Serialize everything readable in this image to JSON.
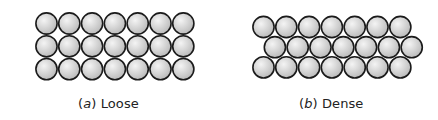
{
  "figure": {
    "panels": [
      {
        "id": "loose",
        "caption_prefix": "(",
        "caption_letter": "a",
        "caption_suffix": ")",
        "caption_text": "Loose",
        "arrangement": "square",
        "rows": 3,
        "cols": 7,
        "row_offsets": [
          0,
          0,
          0
        ]
      },
      {
        "id": "dense",
        "caption_prefix": "(",
        "caption_letter": "b",
        "caption_suffix": ")",
        "caption_text": "Dense",
        "arrangement": "hexagonal",
        "rows": 3,
        "cols": 7,
        "row_offsets": [
          0,
          0.5,
          0
        ]
      }
    ],
    "colors": {
      "sphere_fill_light": "#f4f4f4",
      "sphere_fill_dark": "#b8b8b8",
      "sphere_outline": "#1a1a1a",
      "background": "#ffffff",
      "caption": "#222222"
    }
  }
}
